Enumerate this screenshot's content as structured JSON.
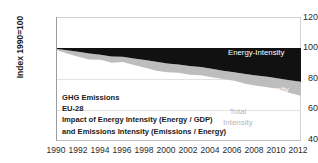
{
  "chart_data": {
    "type": "area",
    "title": "",
    "subtitle": "",
    "xlabel": "",
    "ylabel": "Index 1990=100",
    "ylim": [
      40,
      120
    ],
    "xlim": [
      1990,
      2012
    ],
    "grid": true,
    "stacked": true,
    "legend_position": "in-plot labels",
    "x": [
      1990,
      1991,
      1992,
      1993,
      1994,
      1995,
      1996,
      1997,
      1998,
      1999,
      2000,
      2001,
      2002,
      2003,
      2004,
      2005,
      2006,
      2007,
      2008,
      2009,
      2010,
      2011,
      2012
    ],
    "yticks": [
      40,
      60,
      80,
      100,
      120
    ],
    "xticks": [
      1990,
      1992,
      1994,
      1996,
      1998,
      2000,
      2002,
      2004,
      2006,
      2008,
      2010,
      2012
    ],
    "baseline": 100,
    "series": [
      {
        "name": "Energy-Intensity",
        "color": "#111111",
        "note": "upper boundary of stack (equals baseline 100)",
        "values": [
          100,
          100,
          100,
          100,
          100,
          100,
          100,
          100,
          100,
          100,
          100,
          100,
          100,
          100,
          100,
          100,
          100,
          100,
          100,
          100,
          100,
          100,
          100
        ]
      },
      {
        "name": "Emissions Intensity",
        "color": "#bdbdbd",
        "note": "boundary between Energy-Intensity band and Emissions Intensity band",
        "values": [
          99.5,
          98.6,
          97.6,
          96.4,
          95.6,
          94.5,
          94.3,
          93.2,
          92.2,
          91.1,
          90.0,
          89.4,
          88.4,
          87.8,
          86.6,
          85.4,
          84.4,
          83.2,
          82.2,
          81.4,
          80.4,
          79.2,
          78.3
        ]
      },
      {
        "name": "Total Intensity",
        "color": "#ffffff",
        "note": "lower boundary of stack = total intensity index",
        "values": [
          98.8,
          96.4,
          94.4,
          92.6,
          92.4,
          90.5,
          91.0,
          89.0,
          87.2,
          85.4,
          84.4,
          84.0,
          82.8,
          82.4,
          81.2,
          80.0,
          78.8,
          77.0,
          75.6,
          74.6,
          73.4,
          71.0,
          69.2
        ]
      }
    ],
    "annotations": [
      {
        "name": "Energy-Intensity",
        "text": "Energy-Intensity"
      },
      {
        "name": "Emissions Intensity",
        "text": "Emissions Intensity"
      },
      {
        "name": "Total Intensity",
        "text": "Total\nIntensity"
      }
    ]
  },
  "axis": {
    "y_title": "Index 1990=100",
    "y_ticks": [
      "120",
      "100",
      "80",
      "60",
      "40"
    ],
    "x_ticks": [
      "1990",
      "1992",
      "1994",
      "1996",
      "1998",
      "2000",
      "2002",
      "2004",
      "2006",
      "2008",
      "2010",
      "2012"
    ]
  },
  "note_block": {
    "line1": "GHG Emissions",
    "line2": "EU-28",
    "line3": "Impact of Energy Intensity (Energy / GDP)",
    "line4": "and Emissions Intensity (Emissions / Energy)"
  },
  "series_labels": {
    "energy_intensity": "Energy-Intensity",
    "emissions_intensity": "Emissions Intensity",
    "total_intensity_line1": "Total",
    "total_intensity_line2": "Intensity"
  },
  "colors": {
    "energy_band": "#111111",
    "emissions_band": "#bdbdbd",
    "grid": "#e2e2e2",
    "axis": "#9d9d9d",
    "text": "#2b2b2b",
    "total_label": "#b6b6b6"
  }
}
